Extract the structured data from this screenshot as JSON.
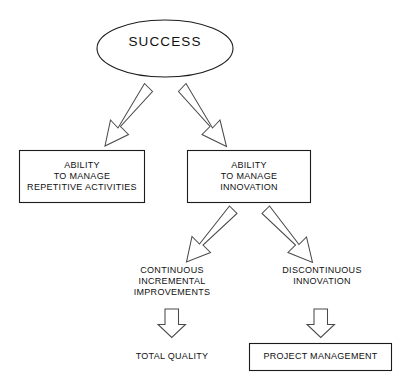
{
  "diagram": {
    "title": "SUCCESS",
    "root": {
      "id": "success",
      "shape": "ellipse",
      "label": "SUCCESS"
    },
    "nodes": [
      {
        "id": "ability-repetitive",
        "shape": "rectangle",
        "label": "ABILITY\nTO MANAGE\nREPETITIVE ACTIVITIES",
        "lines": [
          "ABILITY",
          "TO MANAGE",
          "REPETITIVE ACTIVITIES"
        ]
      },
      {
        "id": "ability-innovation",
        "shape": "rectangle",
        "label": "ABILITY\nTO MANAGE\nINNOVATION",
        "lines": [
          "ABILITY",
          "TO MANAGE",
          "INNOVATION"
        ]
      },
      {
        "id": "continuous-incremental-improvements",
        "shape": "plain-text",
        "label": "CONTINUOUS\nINCREMENTAL\nIMPROVEMENTS",
        "lines": [
          "CONTINUOUS",
          "INCREMENTAL",
          "IMPROVEMENTS"
        ]
      },
      {
        "id": "discontinuous-innovation",
        "shape": "plain-text",
        "label": "DISCONTINUOUS\nINNOVATION",
        "lines": [
          "DISCONTINUOUS",
          "INNOVATION"
        ]
      },
      {
        "id": "total-quality",
        "shape": "plain-text",
        "label": "TOTAL QUALITY",
        "lines": [
          "TOTAL QUALITY"
        ]
      },
      {
        "id": "project-management",
        "shape": "rectangle",
        "label": "PROJECT MANAGEMENT",
        "lines": [
          "PROJECT MANAGEMENT"
        ]
      }
    ],
    "connectors": [
      {
        "id": "success-to-repetitive",
        "from": "success",
        "to": "ability-repetitive",
        "style": "block-arrow",
        "direction": "down-left"
      },
      {
        "id": "success-to-innovation",
        "from": "success",
        "to": "ability-innovation",
        "style": "block-arrow",
        "direction": "down-right"
      },
      {
        "id": "innovation-to-continuous",
        "from": "ability-innovation",
        "to": "continuous-incremental-improvements",
        "style": "block-arrow",
        "direction": "down-left"
      },
      {
        "id": "innovation-to-discontinuous",
        "from": "ability-innovation",
        "to": "discontinuous-innovation",
        "style": "block-arrow",
        "direction": "down-right"
      },
      {
        "id": "continuous-to-total-quality",
        "from": "continuous-incremental-improvements",
        "to": "total-quality",
        "style": "block-arrow",
        "direction": "down"
      },
      {
        "id": "discontinuous-to-project",
        "from": "discontinuous-innovation",
        "to": "project-management",
        "style": "block-arrow",
        "direction": "down"
      }
    ],
    "colors": {
      "background": "#ffffff",
      "shape_stroke": "#1b1b1b",
      "arrow_stroke": "#4a4a4a",
      "shape_fill": "#ffffff",
      "text": "#111111"
    }
  }
}
